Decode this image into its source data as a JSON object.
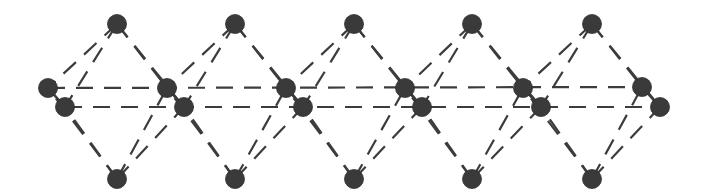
{
  "diagram": {
    "colors": {
      "atom": "#3a3a3a",
      "bond": "#3c3c3c",
      "background": "#ffffff"
    },
    "atom_radius": 9.5,
    "octahedra_count": 5,
    "atoms": {
      "top": [
        [
          117,
          24
        ],
        [
          235,
          24
        ],
        [
          354,
          24
        ],
        [
          472,
          24
        ],
        [
          592,
          24
        ]
      ],
      "bottom": [
        [
          117,
          179
        ],
        [
          235,
          179
        ],
        [
          354,
          179
        ],
        [
          472,
          179
        ],
        [
          592,
          179
        ]
      ],
      "rear_equatorial": [
        [
          48,
          88
        ],
        [
          167,
          88
        ],
        [
          286,
          88
        ],
        [
          405,
          88
        ],
        [
          523,
          88
        ],
        [
          642,
          87
        ]
      ],
      "front_equatorial": [
        [
          65,
          107
        ],
        [
          184,
          107
        ],
        [
          303,
          107
        ],
        [
          422,
          107
        ],
        [
          541,
          107
        ],
        [
          660,
          107
        ]
      ]
    }
  }
}
